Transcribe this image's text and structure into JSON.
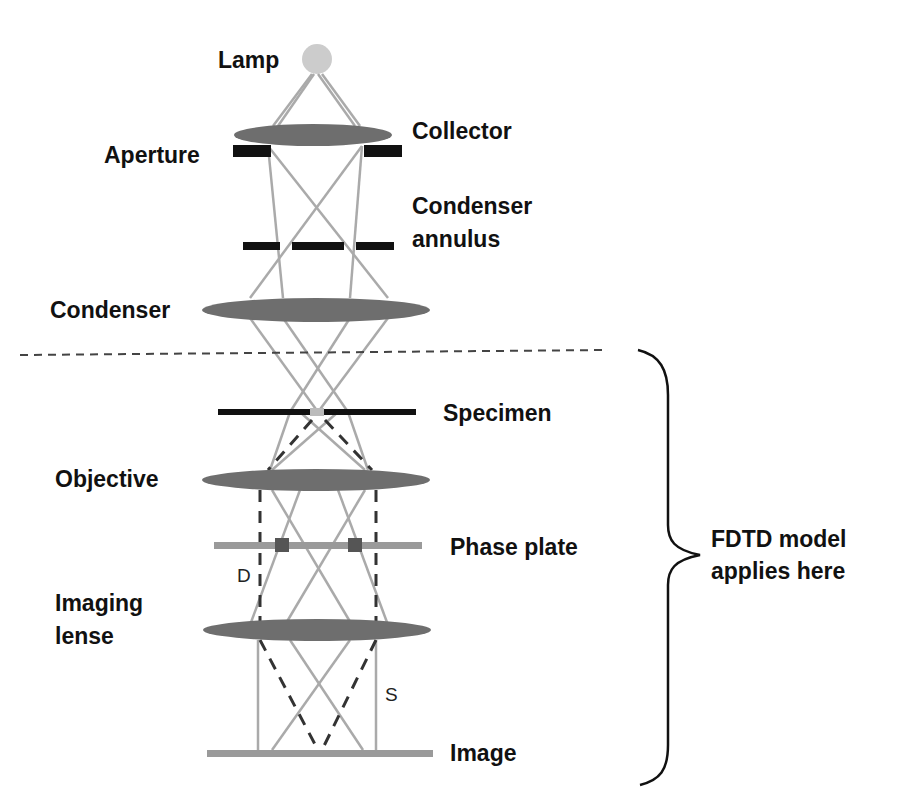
{
  "diagram": {
    "type": "phase-contrast microscope optical path",
    "labels": {
      "lamp": "Lamp",
      "collector": "Collector",
      "aperture": "Aperture",
      "condenser_annulus_1": "Condenser",
      "condenser_annulus_2": "annulus",
      "condenser": "Condenser",
      "specimen": "Specimen",
      "objective": "Objective",
      "phase_plate": "Phase plate",
      "imaging_lense_1": "Imaging",
      "imaging_lense_2": "lense",
      "image": "Image",
      "ray_d": "D",
      "ray_s": "S",
      "fdtd_1": "FDTD model",
      "fdtd_2": "applies here"
    },
    "colors": {
      "lens": "#6e6e6e",
      "ray": "#b0b0b0",
      "stop": "#111111",
      "plate": "#9a9a9a",
      "lamp": "#cccccc"
    }
  }
}
